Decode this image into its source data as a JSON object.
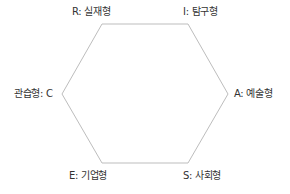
{
  "diagram": {
    "type": "hexagon",
    "stroke_color": "#bdbdbd",
    "text_color": "#333333",
    "vertices": [
      {
        "id": "R",
        "x": 102,
        "y": 24
      },
      {
        "id": "I",
        "x": 188,
        "y": 24
      },
      {
        "id": "A",
        "x": 228,
        "y": 94
      },
      {
        "id": "S",
        "x": 188,
        "y": 163
      },
      {
        "id": "E",
        "x": 102,
        "y": 163
      },
      {
        "id": "C",
        "x": 62,
        "y": 94
      }
    ],
    "labels": {
      "R": "R: 실재형",
      "I": "I: 탐구형",
      "A": "A: 예술형",
      "S": "S: 사회형",
      "E": "E: 기업형",
      "C": "관습형: C"
    }
  }
}
